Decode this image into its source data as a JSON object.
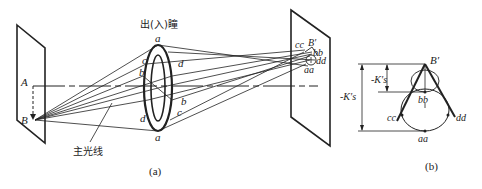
{
  "figure": {
    "panel_a": {
      "caption": "(a)",
      "pupil_label": "出(入)瞳",
      "chief_ray_label": "主光线",
      "object_plane": {
        "point_A": "A",
        "point_B": "B"
      },
      "pupil_points": {
        "a_top": "a",
        "a_bottom": "a",
        "c_left": "c",
        "b_left": "b",
        "d_left": "d",
        "d_right": "d",
        "b_right": "b",
        "c_right": "c"
      },
      "image_plane": {
        "cc": "cc",
        "B_prime": "B′",
        "bb": "bb",
        "dd": "dd",
        "aa": "aa"
      }
    },
    "panel_b": {
      "caption": "(b)",
      "B_prime": "B′",
      "bb": "bb",
      "cc": "cc",
      "dd": "dd",
      "aa": "aa",
      "dim_short": "-K′s",
      "dim_long": "-K′s"
    }
  },
  "colors": {
    "line": "#222222",
    "background": "#ffffff"
  }
}
